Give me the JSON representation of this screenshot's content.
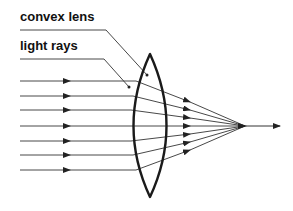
{
  "diagram": {
    "labels": {
      "lens": "convex lens",
      "rays": "light rays"
    },
    "colors": {
      "stroke": "#222222",
      "background": "#ffffff"
    },
    "ray_count": 7,
    "ray_y": [
      81,
      96,
      110,
      126,
      141,
      155,
      170
    ],
    "focal_point": [
      245,
      126
    ]
  }
}
